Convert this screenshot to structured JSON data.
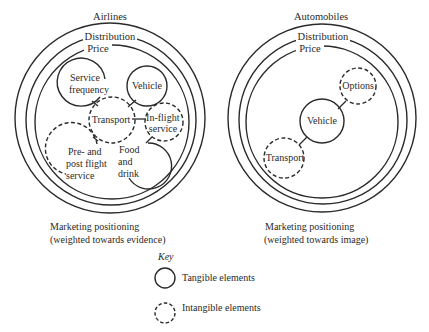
{
  "diagrams": [
    {
      "title": "Airlines",
      "rings": [
        "Distribution",
        "Price"
      ],
      "elements": [
        {
          "label_lines": [
            "Service",
            "frequency"
          ],
          "type": "tangible"
        },
        {
          "label_lines": [
            "Vehicle"
          ],
          "type": "tangible"
        },
        {
          "label_lines": [
            "Transport"
          ],
          "type": "intangible"
        },
        {
          "label_lines": [
            "In-flight",
            "service"
          ],
          "type": "intangible"
        },
        {
          "label_lines": [
            "Pre- and",
            "post flight",
            "service"
          ],
          "type": "intangible"
        },
        {
          "label_lines": [
            "Food",
            "and",
            "drink"
          ],
          "type": "tangible"
        }
      ],
      "caption_lines": [
        "Marketing positioning",
        "(weighted towards evidence)"
      ]
    },
    {
      "title": "Automobiles",
      "rings": [
        "Distribution",
        "Price"
      ],
      "elements": [
        {
          "label_lines": [
            "Options"
          ],
          "type": "intangible"
        },
        {
          "label_lines": [
            "Vehicle"
          ],
          "type": "tangible"
        },
        {
          "label_lines": [
            "Transport"
          ],
          "type": "intangible"
        }
      ],
      "caption_lines": [
        "Marketing positioning",
        "(weighted towards image)"
      ]
    }
  ],
  "key": {
    "title": "Key",
    "items": [
      {
        "label": "Tangible elements",
        "type": "tangible"
      },
      {
        "label": "Intangible elements",
        "type": "intangible"
      }
    ]
  }
}
